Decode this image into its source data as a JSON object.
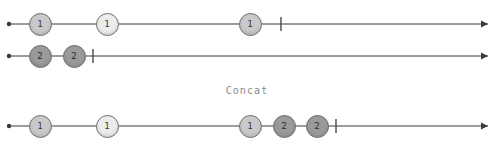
{
  "figure": {
    "clipped_title_text": "MARBLE  DIAGRAM  -  MARBLE  OF  API",
    "operator_label": "Concat",
    "background_color": "#ffffff",
    "axis_color": "#3a3a3a",
    "marble_border_color": "#6e6e6e",
    "shades": {
      "mid": "#c9c9c9",
      "light": "#ececec",
      "dark": "#9a9a9a"
    },
    "width": 494,
    "height": 146
  },
  "timelines": [
    {
      "id": "source-1",
      "role": "input",
      "y": 24,
      "start_x": 9,
      "end_x": 488,
      "complete_tick_x": 281,
      "marbles": [
        {
          "label": "1",
          "x": 40,
          "shade": "mid",
          "diameter": 23
        },
        {
          "label": "1",
          "x": 107,
          "shade": "light",
          "diameter": 23
        },
        {
          "label": "1",
          "x": 250,
          "shade": "mid",
          "diameter": 23
        }
      ]
    },
    {
      "id": "source-2",
      "role": "input",
      "y": 56,
      "start_x": 9,
      "end_x": 488,
      "complete_tick_x": 93,
      "marbles": [
        {
          "label": "2",
          "x": 40,
          "shade": "dark",
          "diameter": 23
        },
        {
          "label": "2",
          "x": 74,
          "shade": "dark",
          "diameter": 23
        }
      ]
    },
    {
      "id": "result",
      "role": "output",
      "y": 126,
      "start_x": 9,
      "end_x": 488,
      "complete_tick_x": 336,
      "marbles": [
        {
          "label": "1",
          "x": 40,
          "shade": "mid",
          "diameter": 23
        },
        {
          "label": "1",
          "x": 107,
          "shade": "light",
          "diameter": 23
        },
        {
          "label": "1",
          "x": 250,
          "shade": "mid",
          "diameter": 23
        },
        {
          "label": "2",
          "x": 284,
          "shade": "dark",
          "diameter": 23
        },
        {
          "label": "2",
          "x": 317,
          "shade": "dark",
          "diameter": 23
        }
      ]
    }
  ],
  "operator": {
    "label": "Concat",
    "y": 91
  }
}
